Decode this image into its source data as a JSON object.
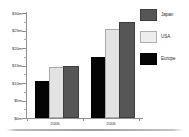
{
  "chart_data": {
    "type": "bar",
    "title": "",
    "xlabel": "",
    "ylabel": "",
    "categories": [
      "2005",
      "2006"
    ],
    "series": [
      {
        "name": "Japan",
        "color": "#565656",
        "values": [
          14.3,
          27.0
        ]
      },
      {
        "name": "USA",
        "color": "#e3e3e3",
        "values": [
          14.0,
          25.0
        ]
      },
      {
        "name": "Europe",
        "color": "#050505",
        "values": [
          10.0,
          17.0
        ]
      }
    ],
    "bar_order_in_group": [
      "Europe",
      "USA",
      "Japan"
    ],
    "ylim": [
      0,
      30
    ],
    "ytick_values": [
      0,
      5,
      10,
      15,
      20,
      25,
      30
    ],
    "ytick_labels": [
      "$0m",
      "$5m",
      "$10m",
      "$15m",
      "$20m",
      "$25m",
      "$30m"
    ],
    "minor_ticks": true,
    "grid": false,
    "legend_position": "top-right",
    "value_prefix": "$",
    "value_suffix": "m"
  },
  "axis": {
    "y": {
      "labels": [
        {
          "text": "$30m",
          "value": 30
        },
        {
          "text": "$25m",
          "value": 25
        },
        {
          "text": "$20m",
          "value": 20
        },
        {
          "text": "$15m",
          "value": 15
        },
        {
          "text": "$10m",
          "value": 10
        },
        {
          "text": "$5m",
          "value": 5
        },
        {
          "text": "$0m",
          "value": 0
        }
      ]
    },
    "x": {
      "labels": [
        {
          "text": "2005"
        },
        {
          "text": "2006"
        }
      ]
    }
  },
  "legend": {
    "items": [
      {
        "label": "Japan",
        "color": "#565656"
      },
      {
        "label": "USA",
        "color": "#e3e3e3"
      },
      {
        "label": "Europe",
        "color": "#050505"
      }
    ]
  }
}
